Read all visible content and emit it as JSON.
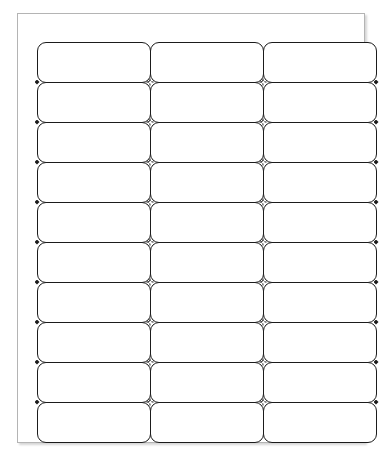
{
  "document": {
    "type": "label-sheet-template",
    "title": "Blank Label Sheet",
    "description": "30-up blank mailing label sheet template, 3 columns by 10 rows",
    "page": {
      "background_color": "#ffffff",
      "border_color": "#b4b4b4",
      "shadow": true
    }
  },
  "grid": {
    "columns": 3,
    "rows": 10,
    "total_labels": 30,
    "label_border_color": "#1b1b1b",
    "label_fill_color": "#ffffff",
    "label_corner_radius_px": 9,
    "column_width_px": 113,
    "row_height_px": 40,
    "registration_mark_color": "#1b1b1b",
    "registration_mark_shape": "diamond"
  },
  "labels": [
    {
      "id": "label-r1c1",
      "row": 1,
      "column": 1,
      "text": ""
    },
    {
      "id": "label-r1c2",
      "row": 1,
      "column": 2,
      "text": ""
    },
    {
      "id": "label-r1c3",
      "row": 1,
      "column": 3,
      "text": ""
    },
    {
      "id": "label-r2c1",
      "row": 2,
      "column": 1,
      "text": ""
    },
    {
      "id": "label-r2c2",
      "row": 2,
      "column": 2,
      "text": ""
    },
    {
      "id": "label-r2c3",
      "row": 2,
      "column": 3,
      "text": ""
    },
    {
      "id": "label-r3c1",
      "row": 3,
      "column": 1,
      "text": ""
    },
    {
      "id": "label-r3c2",
      "row": 3,
      "column": 2,
      "text": ""
    },
    {
      "id": "label-r3c3",
      "row": 3,
      "column": 3,
      "text": ""
    },
    {
      "id": "label-r4c1",
      "row": 4,
      "column": 1,
      "text": ""
    },
    {
      "id": "label-r4c2",
      "row": 4,
      "column": 2,
      "text": ""
    },
    {
      "id": "label-r4c3",
      "row": 4,
      "column": 3,
      "text": ""
    },
    {
      "id": "label-r5c1",
      "row": 5,
      "column": 1,
      "text": ""
    },
    {
      "id": "label-r5c2",
      "row": 5,
      "column": 2,
      "text": ""
    },
    {
      "id": "label-r5c3",
      "row": 5,
      "column": 3,
      "text": ""
    },
    {
      "id": "label-r6c1",
      "row": 6,
      "column": 1,
      "text": ""
    },
    {
      "id": "label-r6c2",
      "row": 6,
      "column": 2,
      "text": ""
    },
    {
      "id": "label-r6c3",
      "row": 6,
      "column": 3,
      "text": ""
    },
    {
      "id": "label-r7c1",
      "row": 7,
      "column": 1,
      "text": ""
    },
    {
      "id": "label-r7c2",
      "row": 7,
      "column": 2,
      "text": ""
    },
    {
      "id": "label-r7c3",
      "row": 7,
      "column": 3,
      "text": ""
    },
    {
      "id": "label-r8c1",
      "row": 8,
      "column": 1,
      "text": ""
    },
    {
      "id": "label-r8c2",
      "row": 8,
      "column": 2,
      "text": ""
    },
    {
      "id": "label-r8c3",
      "row": 8,
      "column": 3,
      "text": ""
    },
    {
      "id": "label-r9c1",
      "row": 9,
      "column": 1,
      "text": ""
    },
    {
      "id": "label-r9c2",
      "row": 9,
      "column": 2,
      "text": ""
    },
    {
      "id": "label-r9c3",
      "row": 9,
      "column": 3,
      "text": ""
    },
    {
      "id": "label-r10c1",
      "row": 10,
      "column": 1,
      "text": ""
    },
    {
      "id": "label-r10c2",
      "row": 10,
      "column": 2,
      "text": ""
    },
    {
      "id": "label-r10c3",
      "row": 10,
      "column": 3,
      "text": ""
    }
  ]
}
